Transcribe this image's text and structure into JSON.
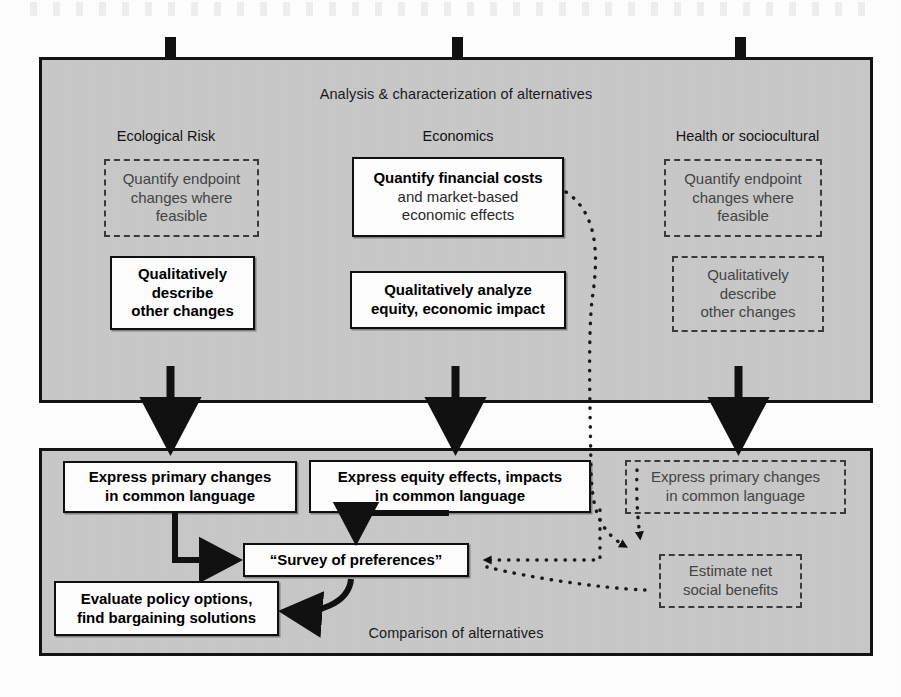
{
  "panels": {
    "top": {
      "caption": "Analysis & characterization of alternatives"
    },
    "bottom": {
      "caption": "Comparison of alternatives"
    }
  },
  "columns": [
    {
      "heading": "Ecological Risk"
    },
    {
      "heading": "Economics"
    },
    {
      "heading": "Health or sociocultural"
    }
  ],
  "top_boxes": [
    {
      "id": "eco-risk-quantify",
      "style": "dashed",
      "lines": [
        "Quantify endpoint",
        "changes where",
        "feasible"
      ]
    },
    {
      "id": "eco-risk-qualitative",
      "style": "solid",
      "lines": [
        "Qualitatively",
        "describe",
        "other changes"
      ]
    },
    {
      "id": "economics-quantify",
      "style": "solid",
      "bold_lines": [
        "Quantify financial costs"
      ],
      "plain_lines": [
        "and market-based",
        "economic effects"
      ]
    },
    {
      "id": "economics-qualitative",
      "style": "solid",
      "lines": [
        "Qualitatively analyze",
        "equity, economic impact"
      ]
    },
    {
      "id": "health-quantify",
      "style": "dashed",
      "lines": [
        "Quantify endpoint",
        "changes where",
        "feasible"
      ]
    },
    {
      "id": "health-qualitative",
      "style": "dashed",
      "lines": [
        "Qualitatively",
        "describe",
        "other changes"
      ]
    }
  ],
  "bottom_boxes": [
    {
      "id": "express-primary-changes",
      "style": "solid",
      "lines": [
        "Express primary changes",
        "in common language"
      ]
    },
    {
      "id": "express-equity-effects",
      "style": "solid",
      "lines": [
        "Express equity effects, impacts",
        "in common language"
      ]
    },
    {
      "id": "express-primary-changes-health",
      "style": "dashed",
      "lines": [
        "Express primary changes",
        "in common language"
      ]
    },
    {
      "id": "survey-of-preferences",
      "style": "solid",
      "lines": [
        "“Survey of preferences”"
      ]
    },
    {
      "id": "evaluate-policy-options",
      "style": "solid",
      "lines": [
        "Evaluate policy options,",
        "find bargaining solutions"
      ]
    },
    {
      "id": "estimate-net-social-benefits",
      "style": "dashed",
      "lines": [
        "Estimate net",
        "social benefits"
      ]
    }
  ],
  "colors": {
    "panel_fill": "#c9c9c9",
    "panel_border": "#141414",
    "box_fill": "#ffffff",
    "solid_border": "#101010",
    "dashed_border": "#3b3b3b",
    "dashed_text": "#444444",
    "arrow": "#111111"
  }
}
